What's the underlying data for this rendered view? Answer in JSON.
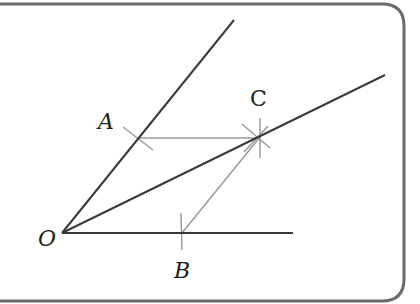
{
  "diagram": {
    "colors": {
      "frame": "#6b6b6b",
      "ray": "#3a3a3a",
      "construction": "#9a9a9a",
      "label": "#222222",
      "background": "#ffffff"
    },
    "points": {
      "O": {
        "label": "O",
        "x": 62,
        "y": 233
      },
      "A": {
        "label": "A",
        "x": 139,
        "y": 138
      },
      "B": {
        "label": "B",
        "x": 182,
        "y": 233
      },
      "C": {
        "label": "C",
        "x": 260,
        "y": 137
      }
    },
    "rays": [
      {
        "name": "upper-ray",
        "from": "O",
        "to": [
          234,
          20
        ]
      },
      {
        "name": "bisector-ray",
        "from": "O",
        "to": [
          385,
          75
        ]
      },
      {
        "name": "lower-ray",
        "from": "O",
        "to": [
          293,
          233
        ]
      }
    ],
    "construction_lines": [
      {
        "name": "segment-AC",
        "from": "A",
        "to": "C"
      },
      {
        "name": "segment-BC",
        "from": "B",
        "to": "C"
      }
    ],
    "labels": {
      "O": "O",
      "A": "A",
      "B": "B",
      "C": "C"
    }
  }
}
